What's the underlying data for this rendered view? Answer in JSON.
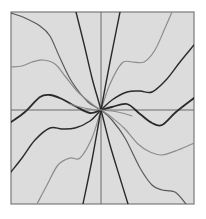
{
  "chart_data": {
    "type": "line",
    "title": "",
    "xlabel": "",
    "ylabel": "",
    "grid": false,
    "legend": null,
    "axes": {
      "frame": {
        "x0": 11,
        "y0": 12,
        "x1": 194,
        "y1": 204
      },
      "origin": {
        "x": 101,
        "y": 110
      },
      "x_axis_visible": true,
      "y_axis_visible": true,
      "ticks": false
    },
    "colors": {
      "background": "#ffffff",
      "plot_bg": "#dcdcdc",
      "frame": "#7a7a7a",
      "axis": "#6a6a6a",
      "dark": "#2a2a2a",
      "mid": "#5a5a5a",
      "light": "#8c8c8c"
    },
    "series": [
      {
        "name": "curve-sine-center",
        "tone": "dark",
        "width": 1.8,
        "points": [
          [
            11,
            122
          ],
          [
            25,
            112
          ],
          [
            40,
            97
          ],
          [
            50,
            95
          ],
          [
            62,
            99
          ],
          [
            75,
            106
          ],
          [
            90,
            113
          ],
          [
            101,
            110
          ],
          [
            112,
            107
          ],
          [
            127,
            104
          ],
          [
            140,
            114
          ],
          [
            152,
            123
          ],
          [
            162,
            125
          ],
          [
            176,
            112
          ],
          [
            194,
            98
          ]
        ]
      },
      {
        "name": "curve-a",
        "tone": "dark",
        "width": 1.4,
        "points": [
          [
            11,
            172
          ],
          [
            22,
            158
          ],
          [
            35,
            140
          ],
          [
            50,
            128
          ],
          [
            62,
            129
          ],
          [
            75,
            128
          ],
          [
            90,
            121
          ],
          [
            101,
            110
          ],
          [
            112,
            100
          ],
          [
            127,
            92
          ],
          [
            140,
            91
          ],
          [
            152,
            92
          ],
          [
            166,
            80
          ],
          [
            180,
            62
          ],
          [
            194,
            45
          ]
        ]
      },
      {
        "name": "curve-b",
        "tone": "light",
        "width": 1.2,
        "points": [
          [
            37,
            204
          ],
          [
            47,
            185
          ],
          [
            58,
            165
          ],
          [
            70,
            158
          ],
          [
            80,
            158
          ],
          [
            92,
            138
          ],
          [
            101,
            110
          ],
          [
            110,
            84
          ],
          [
            122,
            63
          ],
          [
            132,
            62
          ],
          [
            144,
            62
          ],
          [
            155,
            50
          ],
          [
            165,
            28
          ],
          [
            172,
            12
          ]
        ]
      },
      {
        "name": "line-c",
        "tone": "dark",
        "width": 1.4,
        "points": [
          [
            83,
            204
          ],
          [
            92,
            160
          ],
          [
            101,
            110
          ],
          [
            110,
            62
          ],
          [
            120,
            12
          ]
        ]
      },
      {
        "name": "curve-d",
        "tone": "mid",
        "width": 1.2,
        "points": [
          [
            11,
            13
          ],
          [
            25,
            18
          ],
          [
            40,
            26
          ],
          [
            50,
            36
          ],
          [
            60,
            58
          ],
          [
            72,
            82
          ],
          [
            88,
            102
          ],
          [
            101,
            110
          ],
          [
            112,
            120
          ],
          [
            125,
            138
          ],
          [
            140,
            168
          ],
          [
            152,
            185
          ],
          [
            162,
            190
          ],
          [
            175,
            192
          ],
          [
            186,
            204
          ]
        ]
      },
      {
        "name": "curve-e",
        "tone": "light",
        "width": 1.2,
        "points": [
          [
            11,
            67
          ],
          [
            22,
            66
          ],
          [
            32,
            62
          ],
          [
            43,
            60
          ],
          [
            55,
            64
          ],
          [
            65,
            76
          ],
          [
            78,
            92
          ],
          [
            92,
            104
          ],
          [
            101,
            110
          ],
          [
            110,
            116
          ],
          [
            124,
            128
          ],
          [
            138,
            144
          ],
          [
            150,
            152
          ],
          [
            162,
            155
          ],
          [
            178,
            150
          ],
          [
            194,
            143
          ]
        ]
      },
      {
        "name": "line-f",
        "tone": "dark",
        "width": 1.4,
        "points": [
          [
            76,
            12
          ],
          [
            84,
            44
          ],
          [
            92,
            78
          ],
          [
            101,
            110
          ],
          [
            110,
            145
          ],
          [
            120,
            178
          ],
          [
            128,
            204
          ]
        ]
      },
      {
        "name": "curve-g",
        "tone": "light",
        "width": 1.1,
        "points": [
          [
            70,
            104
          ],
          [
            80,
            107
          ],
          [
            90,
            109
          ],
          [
            101,
            110
          ],
          [
            112,
            111
          ],
          [
            122,
            113
          ],
          [
            132,
            116
          ]
        ]
      }
    ]
  }
}
